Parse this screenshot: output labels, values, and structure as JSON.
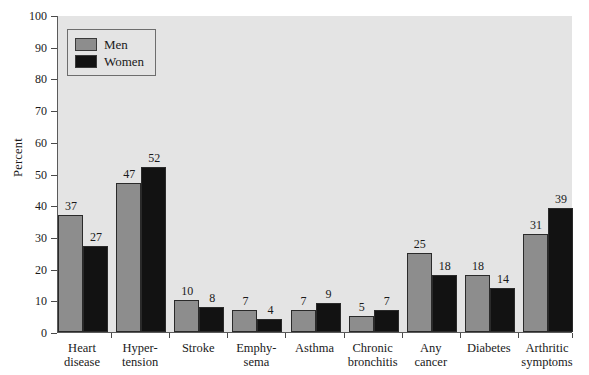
{
  "chart_data": {
    "type": "bar",
    "title": "",
    "xlabel": "",
    "ylabel": "Percent",
    "ylim": [
      0,
      100
    ],
    "ytick_step": 10,
    "yticks": [
      100,
      90,
      80,
      70,
      60,
      50,
      40,
      30,
      20,
      10,
      0
    ],
    "grid": false,
    "legend_position": "upper left",
    "categories": [
      "Heart disease",
      "Hyper-tension",
      "Stroke",
      "Emphy-sema",
      "Asthma",
      "Chronic bronchitis",
      "Any cancer",
      "Diabetes",
      "Arthritic symptoms"
    ],
    "category_lines": [
      [
        "Heart",
        "disease"
      ],
      [
        "Hyper-",
        "tension"
      ],
      [
        "Stroke",
        ""
      ],
      [
        "Emphy-",
        "sema"
      ],
      [
        "Asthma",
        ""
      ],
      [
        "Chronic",
        "bronchitis"
      ],
      [
        "Any",
        "cancer"
      ],
      [
        "Diabetes",
        ""
      ],
      [
        "Arthritic",
        "symptoms"
      ]
    ],
    "series": [
      {
        "name": "Men",
        "color": "#8d8d8d",
        "values": [
          37,
          47,
          10,
          7,
          7,
          5,
          25,
          18,
          31
        ]
      },
      {
        "name": "Women",
        "color": "#121212",
        "values": [
          27,
          52,
          8,
          4,
          9,
          7,
          18,
          14,
          39
        ]
      }
    ]
  },
  "legend": {
    "items": [
      {
        "label": "Men",
        "swatch": "men-swatch"
      },
      {
        "label": "Women",
        "swatch": "women-swatch"
      }
    ]
  },
  "axis": {
    "y_title": "Percent"
  },
  "colors": {
    "plot_background": "#e4e4e4",
    "men_bar": "#8d8d8d",
    "women_bar": "#121212",
    "axis_line": "#5a5a5a",
    "bar_outline": "#2a2a2a"
  }
}
